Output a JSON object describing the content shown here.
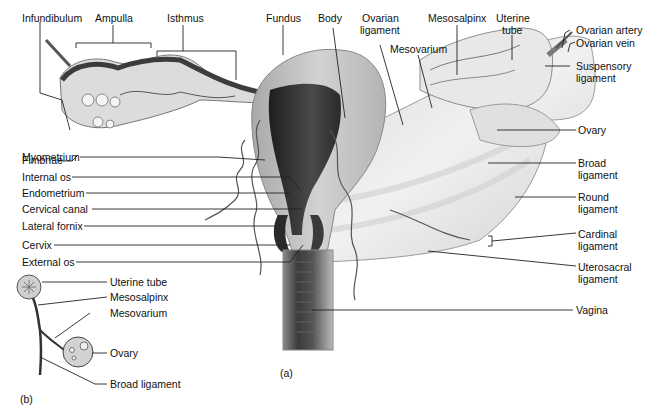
{
  "figure": {
    "panel_a_label": "(a)",
    "panel_b_label": "(b)"
  },
  "panel_a": {
    "top_labels": {
      "infundibulum": "Infundibulum",
      "ampulla": "Ampulla",
      "isthmus": "Isthmus",
      "fundus": "Fundus",
      "body": "Body",
      "ovarian_ligament_1": "Ovarian",
      "ovarian_ligament_2": "ligament",
      "mesosalpinx": "Mesosalpinx",
      "mesovarium": "Mesovarium",
      "uterine_tube_1": "Uterine",
      "uterine_tube_2": "tube"
    },
    "left_labels": {
      "fimbriae": "Fimbriae",
      "myometrium": "Myometrium",
      "internal_os": "Internal os",
      "endometrium": "Endometrium",
      "cervical_canal": "Cervical canal",
      "lateral_fornix": "Lateral fornix",
      "cervix": "Cervix",
      "external_os": "External os"
    },
    "right_labels": {
      "ovarian_artery": "Ovarian artery",
      "ovarian_vein": "Ovarian vein",
      "suspensory_1": "Suspensory",
      "suspensory_2": "ligament",
      "ovary": "Ovary",
      "broad_1": "Broad",
      "broad_2": "ligament",
      "round_1": "Round",
      "round_2": "ligament",
      "cardinal_1": "Cardinal",
      "cardinal_2": "ligament",
      "uterosacral_1": "Uterosacral",
      "uterosacral_2": "ligament",
      "vagina": "Vagina"
    }
  },
  "panel_b": {
    "uterine_tube": "Uterine tube",
    "mesosalpinx": "Mesosalpinx",
    "mesovarium": "Mesovarium",
    "ovary": "Ovary",
    "broad_ligament": "Broad ligament"
  },
  "colors": {
    "background": "#ffffff",
    "text": "#111111",
    "tissue_light": "#e6e6e6",
    "tissue_mid": "#bdbdbd",
    "tissue_dark": "#3a3a3a"
  }
}
